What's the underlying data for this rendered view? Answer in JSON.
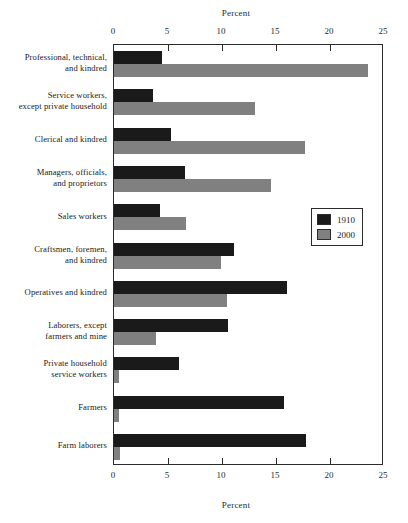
{
  "chart_data": {
    "type": "bar",
    "orientation": "horizontal",
    "title": "",
    "xlabel": "Percent",
    "ylabel": "",
    "xlim": [
      0,
      25
    ],
    "xticks": [
      0,
      5,
      10,
      15,
      20,
      25
    ],
    "xtick_labels": [
      "0",
      "5",
      "10",
      "15",
      "20",
      "25"
    ],
    "grid": false,
    "axis_title_top": "Percent",
    "axis_title_bottom": "Percent",
    "legend_position": "center-right",
    "categories": [
      "Professional, technical, and kindred",
      "Service workers, except private household",
      "Clerical and kindred",
      "Managers, officials, and proprietors",
      "Sales workers",
      "Craftsmen, foremen, and kindred",
      "Operatives and kindred",
      "Laborers, except farmers and mine",
      "Private household service workers",
      "Farmers",
      "Farm laborers"
    ],
    "category_lines": [
      [
        "Professional, technical,",
        "and kindred"
      ],
      [
        "Service workers,",
        "except private household"
      ],
      [
        "Clerical and kindred"
      ],
      [
        "Managers, officials,",
        "and proprietors"
      ],
      [
        "Sales workers"
      ],
      [
        "Craftsmen, foremen,",
        "and kindred"
      ],
      [
        "Operatives and kindred"
      ],
      [
        "Laborers, except",
        "farmers and mine"
      ],
      [
        "Private household",
        "service workers"
      ],
      [
        "Farmers"
      ],
      [
        "Farm laborers"
      ]
    ],
    "series": [
      {
        "name": "1910",
        "color": "#1a1a1a",
        "values": [
          4.4,
          3.6,
          5.3,
          6.6,
          4.3,
          11.1,
          16.0,
          10.6,
          6.0,
          15.7,
          17.8
        ]
      },
      {
        "name": "2000",
        "color": "#808080",
        "values": [
          23.5,
          13.1,
          17.7,
          14.5,
          6.7,
          9.9,
          10.5,
          3.9,
          0.5,
          0.5,
          0.6
        ]
      }
    ]
  },
  "legend": {
    "entries": [
      {
        "label": "1910",
        "color": "#1a1a1a"
      },
      {
        "label": "2000",
        "color": "#808080"
      }
    ]
  }
}
